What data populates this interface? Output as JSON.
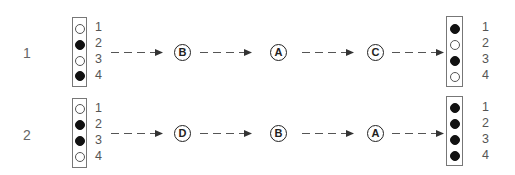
{
  "rows": [
    {
      "label": "1",
      "start": {
        "pins": [
          "1",
          "2",
          "3",
          "4"
        ],
        "states": [
          "off",
          "on",
          "off",
          "on"
        ]
      },
      "steps": [
        "B",
        "A",
        "C"
      ],
      "end": {
        "pins": [
          "1",
          "2",
          "3",
          "4"
        ],
        "states": [
          "on",
          "off",
          "on",
          "off"
        ]
      }
    },
    {
      "label": "2",
      "start": {
        "pins": [
          "1",
          "2",
          "3",
          "4"
        ],
        "states": [
          "off",
          "on",
          "on",
          "off"
        ]
      },
      "steps": [
        "D",
        "B",
        "A"
      ],
      "end": {
        "pins": [
          "1",
          "2",
          "3",
          "4"
        ],
        "states": [
          "on",
          "on",
          "on",
          "on"
        ]
      }
    }
  ],
  "colors": {
    "filled": "#111111",
    "outline": "#555555",
    "box": "#777777"
  }
}
